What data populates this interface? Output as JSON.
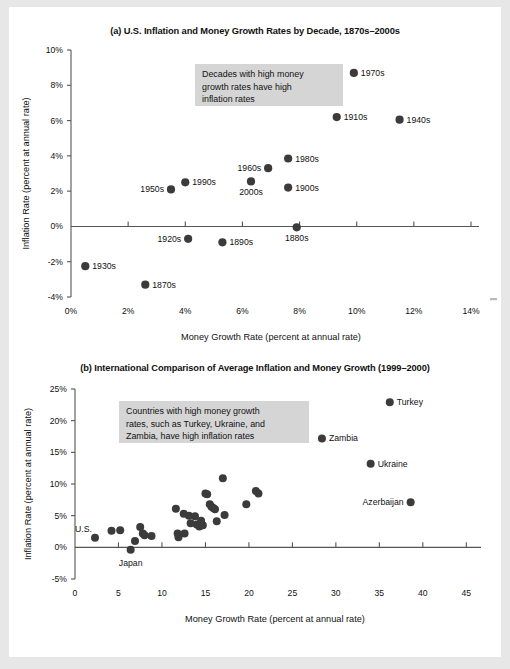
{
  "figure": {
    "background_color": "#e7e7e7",
    "sheet_color": "#ffffff",
    "point_color": "#3b3b3b",
    "annotation_bg": "#d5d5d5"
  },
  "panel_a": {
    "title": "(a) U.S. Inflation and Money Growth Rates by Decade, 1870s–2000s",
    "annotation": [
      "Decades with high money",
      "growth rates have high",
      "inflation rates"
    ],
    "xlabel": "Money Growth Rate (percent at annual rate)",
    "ylabel": "Inflation Rate (percent at annual rate)",
    "xticks": [
      "0%",
      "2%",
      "4%",
      "6%",
      "8%",
      "10%",
      "12%",
      "14%"
    ],
    "yticks": [
      "10%",
      "8%",
      "6%",
      "4%",
      "2%",
      "0%",
      "-2%",
      "-4%"
    ]
  },
  "panel_b": {
    "title": "(b) International Comparison of Average Inflation and Money Growth (1999–2000)",
    "annotation": [
      "Countries with high money growth",
      "rates, such as Turkey, Ukraine, and",
      "Zambia, have high inflation rates"
    ],
    "xlabel": "Money Growth Rate (percent at annual rate)",
    "ylabel": "Inflation Rate (percent at annual rate)",
    "xticks": [
      "0",
      "5",
      "10",
      "15",
      "20",
      "25",
      "30",
      "35",
      "40",
      "45"
    ],
    "yticks": [
      "25%",
      "20%",
      "15%",
      "10%",
      "5%",
      "0%",
      "-5%"
    ]
  },
  "chart_data": [
    {
      "type": "scatter",
      "panel": "a",
      "title": "(a) U.S. Inflation and Money Growth Rates by Decade, 1870s–2000s",
      "xlabel": "Money Growth Rate (percent at annual rate)",
      "ylabel": "Inflation Rate (percent at annual rate)",
      "xlim": [
        0,
        14
      ],
      "ylim": [
        -4,
        10
      ],
      "grid": false,
      "legend": "none",
      "labels": [
        "1870s",
        "1880s",
        "1890s",
        "1900s",
        "1910s",
        "1920s",
        "1930s",
        "1940s",
        "1950s",
        "1960s",
        "1970s",
        "1980s",
        "1990s",
        "2000s"
      ],
      "x": [
        2.6,
        7.9,
        5.3,
        7.6,
        9.3,
        4.1,
        0.5,
        11.5,
        3.5,
        6.9,
        9.9,
        7.6,
        4.0,
        6.3
      ],
      "y": [
        -3.3,
        -0.05,
        -0.9,
        2.2,
        6.2,
        -0.7,
        -2.25,
        6.05,
        2.1,
        3.3,
        8.7,
        3.85,
        2.5,
        2.55
      ],
      "label_side": [
        "right",
        "below",
        "right",
        "right",
        "right",
        "left",
        "right",
        "right",
        "left",
        "left",
        "right",
        "right",
        "right",
        "below"
      ]
    },
    {
      "type": "scatter",
      "panel": "b",
      "title": "(b) International Comparison of Average Inflation and Money Growth (1999–2000)",
      "xlabel": "Money Growth Rate (percent at annual rate)",
      "ylabel": "Inflation Rate (percent at annual rate)",
      "xlim": [
        0,
        46
      ],
      "ylim": [
        -5,
        25
      ],
      "grid": false,
      "legend": "none",
      "named_points": [
        {
          "label": "Turkey",
          "x": 36.2,
          "y": 22.9,
          "label_side": "right"
        },
        {
          "label": "Zambia",
          "x": 28.4,
          "y": 17.2,
          "label_side": "right"
        },
        {
          "label": "Ukraine",
          "x": 34.0,
          "y": 13.2,
          "label_side": "right"
        },
        {
          "label": "Azerbaijan",
          "x": 38.6,
          "y": 7.1,
          "label_side": "left"
        },
        {
          "label": "U.S.",
          "x": 2.3,
          "y": 1.5,
          "label_side": "above-left"
        },
        {
          "label": "Japan",
          "x": 6.4,
          "y": -0.4,
          "label_side": "below"
        }
      ],
      "x": [
        4.2,
        5.2,
        6.9,
        7.5,
        7.8,
        8.0,
        8.8,
        11.6,
        11.8,
        11.9,
        12.5,
        12.6,
        13.1,
        13.3,
        13.8,
        14.0,
        14.3,
        14.5,
        14.6,
        14.7,
        15.0,
        15.2,
        15.5,
        15.7,
        15.9,
        16.1,
        16.3,
        17.0,
        17.2,
        19.7,
        20.8,
        21.1
      ],
      "y": [
        2.6,
        2.7,
        1.0,
        3.2,
        2.2,
        1.9,
        1.8,
        6.1,
        2.2,
        1.6,
        5.3,
        2.2,
        5.0,
        3.8,
        4.9,
        3.6,
        3.3,
        4.2,
        3.5,
        3.5,
        8.5,
        8.4,
        6.8,
        6.4,
        6.2,
        6.0,
        4.1,
        10.9,
        5.1,
        6.8,
        8.9,
        8.5
      ]
    }
  ]
}
